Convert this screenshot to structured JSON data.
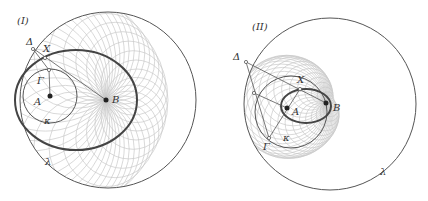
{
  "figure": {
    "panels": [
      {
        "id": "I",
        "label": "(I)",
        "points": {
          "A": "A",
          "B": "B",
          "Gamma": "Γ",
          "Delta": "Δ",
          "X": "X",
          "kappa": "κ",
          "lambda": "λ"
        },
        "outer_circle": {
          "name": "λ",
          "cx": 108,
          "cy": 100,
          "r": 88
        },
        "inner_circle": {
          "name": "κ",
          "cx": 50,
          "cy": 96,
          "r": 27
        },
        "ellipse": {
          "cx": 76,
          "cy": 100,
          "rx": 61,
          "ry": 50
        },
        "focus_A": [
          50,
          96
        ],
        "focus_B": [
          106,
          100
        ]
      },
      {
        "id": "II",
        "label": "(II)",
        "points": {
          "A": "A",
          "B": "B",
          "Gamma": "Γ",
          "Delta": "Δ",
          "X": "X",
          "kappa": "κ",
          "lambda": "λ"
        },
        "outer_circle": {
          "name": "λ",
          "cx": 330,
          "cy": 104,
          "r": 86
        },
        "inner_circle": {
          "name": "κ",
          "cx": 291,
          "cy": 112,
          "r": 36
        },
        "ellipse": {
          "cx": 306,
          "cy": 106,
          "rx": 25,
          "ry": 17
        },
        "focus_A": [
          287,
          108
        ],
        "focus_B": [
          326,
          103
        ]
      }
    ],
    "colors": {
      "stroke_dark": "#555555",
      "stroke_thick": "#444444",
      "stroke_family": "#c8c8c8",
      "point_fill": "#222222"
    }
  }
}
